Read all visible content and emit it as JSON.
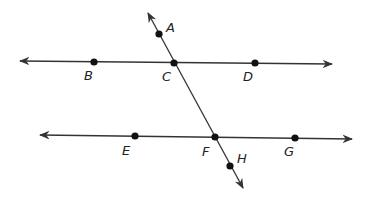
{
  "diagram": {
    "colors": {
      "line": "#333333",
      "point": "#111111",
      "label": "#222222",
      "background": "#ffffff"
    },
    "lines": [
      {
        "id": "line-BD",
        "name": "top-parallel-line",
        "from": [
          20,
          61
        ],
        "to": [
          332,
          64
        ],
        "arrows": "both"
      },
      {
        "id": "line-EG",
        "name": "bottom-parallel-line",
        "from": [
          40,
          135
        ],
        "to": [
          352,
          139
        ],
        "arrows": "both"
      },
      {
        "id": "transversal-AH",
        "name": "transversal-line",
        "from": [
          148,
          13
        ],
        "to": [
          243,
          188
        ],
        "arrows": "both"
      }
    ],
    "points": [
      {
        "label": "A",
        "x": 159,
        "y": 34,
        "lx": 166,
        "ly": 32
      },
      {
        "label": "B",
        "x": 94,
        "y": 62,
        "lx": 84,
        "ly": 80
      },
      {
        "label": "C",
        "x": 174,
        "y": 63,
        "lx": 162,
        "ly": 81
      },
      {
        "label": "D",
        "x": 255,
        "y": 63,
        "lx": 243,
        "ly": 81
      },
      {
        "label": "E",
        "x": 135,
        "y": 136,
        "lx": 122,
        "ly": 155
      },
      {
        "label": "F",
        "x": 215,
        "y": 137,
        "lx": 202,
        "ly": 156
      },
      {
        "label": "G",
        "x": 295,
        "y": 138,
        "lx": 284,
        "ly": 156
      },
      {
        "label": "H",
        "x": 230,
        "y": 166,
        "lx": 237,
        "ly": 163
      }
    ]
  }
}
